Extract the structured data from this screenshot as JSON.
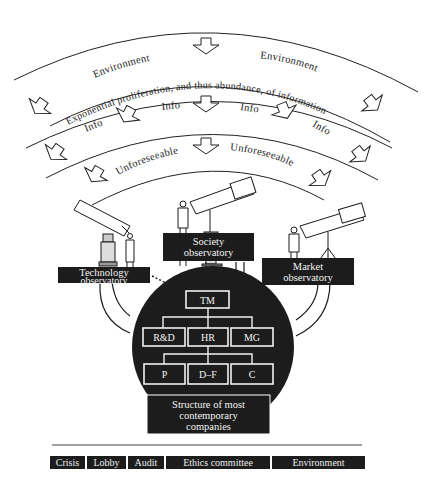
{
  "diagram": {
    "arcs": {
      "outer_band": {
        "labels": [
          "Environment",
          "Environment"
        ]
      },
      "middle_band": {
        "caption": "Exponential proliferation, and thus abundance, of information",
        "info_labels": [
          "Info",
          "Info",
          "Info",
          "Info"
        ]
      },
      "inner_band": {
        "labels": [
          "Unforeseeable",
          "Unforeseeable"
        ]
      }
    },
    "observatories": [
      {
        "id": "technology",
        "line1": "Technology",
        "line2": "observatory"
      },
      {
        "id": "society",
        "line1": "Society",
        "line2": "observatory"
      },
      {
        "id": "market",
        "line1": "Market",
        "line2": "observatory"
      }
    ],
    "org_chart": {
      "top": "TM",
      "level2": [
        "R&D",
        "HR",
        "MG"
      ],
      "level3": [
        "P",
        "D–F",
        "C"
      ]
    },
    "company_box": {
      "line1": "Structure of most",
      "line2": "contemporary",
      "line3": "companies"
    },
    "footer_tags": [
      "Crisis",
      "Lobby",
      "Audit",
      "Ethics committee",
      "Environment"
    ],
    "colors": {
      "ink": "#1a1a1a",
      "paper": "#ffffff",
      "box_fill": "#1c1c1c",
      "box_text": "#f2f2f2"
    }
  }
}
